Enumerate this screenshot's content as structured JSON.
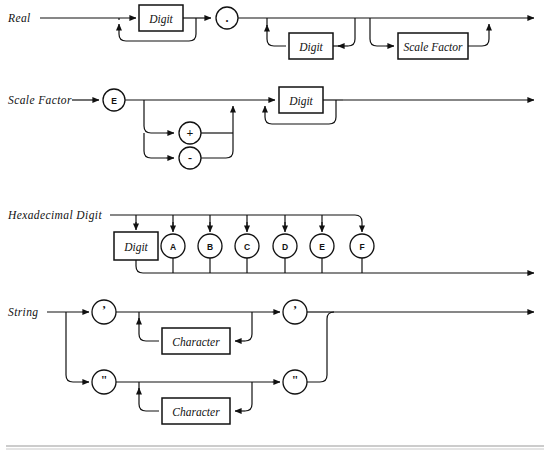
{
  "page": {
    "background_color": "#ffffff",
    "line_color": "#111111",
    "rule_color": "#9a9a9a",
    "width": 550,
    "height": 459
  },
  "diagrams": [
    {
      "id": "real",
      "lhs_label": "Real",
      "nodes": [
        {
          "kind": "box",
          "label": "Digit",
          "name": "digit-box-1"
        },
        {
          "kind": "circle",
          "label": ".",
          "name": "period-circle"
        },
        {
          "kind": "box",
          "label": "Digit",
          "name": "digit-box-2"
        },
        {
          "kind": "box",
          "label": "Scale Factor",
          "name": "scale-factor-box"
        }
      ]
    },
    {
      "id": "scale-factor",
      "lhs_label": "Scale Factor",
      "nodes": [
        {
          "kind": "circle",
          "label": "E",
          "name": "e-circle"
        },
        {
          "kind": "circle",
          "label": "+",
          "name": "plus-circle"
        },
        {
          "kind": "circle",
          "label": "-",
          "name": "minus-circle"
        },
        {
          "kind": "box",
          "label": "Digit",
          "name": "digit-box-3"
        }
      ]
    },
    {
      "id": "hexadecimal-digit",
      "lhs_label": "Hexadecimal Digit",
      "nodes": [
        {
          "kind": "box",
          "label": "Digit",
          "name": "digit-box-4"
        },
        {
          "kind": "circle",
          "label": "A",
          "name": "a-circle"
        },
        {
          "kind": "circle",
          "label": "B",
          "name": "b-circle"
        },
        {
          "kind": "circle",
          "label": "C",
          "name": "c-circle"
        },
        {
          "kind": "circle",
          "label": "D",
          "name": "d-circle"
        },
        {
          "kind": "circle",
          "label": "E",
          "name": "e-hex-circle"
        },
        {
          "kind": "circle",
          "label": "F",
          "name": "f-circle"
        }
      ]
    },
    {
      "id": "string",
      "lhs_label": "String",
      "nodes": [
        {
          "kind": "circle",
          "label": "’",
          "name": "single-quote-open-circle"
        },
        {
          "kind": "box",
          "label": "Character",
          "name": "character-box-1"
        },
        {
          "kind": "circle",
          "label": "’",
          "name": "single-quote-close-circle"
        },
        {
          "kind": "circle",
          "label": "\"",
          "name": "double-quote-open-circle"
        },
        {
          "kind": "box",
          "label": "Character",
          "name": "character-box-2"
        },
        {
          "kind": "circle",
          "label": "\"",
          "name": "double-quote-close-circle"
        }
      ]
    }
  ]
}
